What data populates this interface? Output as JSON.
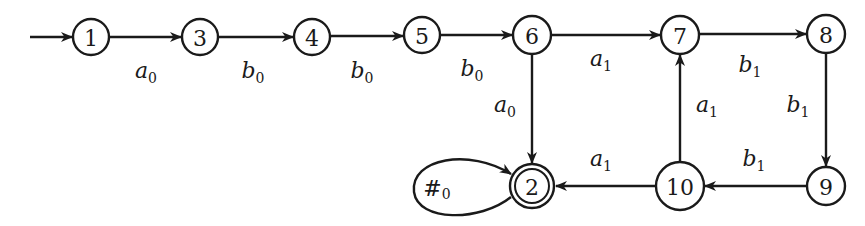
{
  "diagram": {
    "type": "finite-automaton",
    "start_state": "1",
    "accepting_states": [
      "2"
    ],
    "states": [
      {
        "id": "1",
        "label": "1",
        "x": 91,
        "y": 37,
        "r": 18,
        "accepting": false
      },
      {
        "id": "3",
        "label": "3",
        "x": 200,
        "y": 37,
        "r": 18,
        "accepting": false
      },
      {
        "id": "4",
        "label": "4",
        "x": 312,
        "y": 37,
        "r": 18,
        "accepting": false
      },
      {
        "id": "5",
        "label": "5",
        "x": 422,
        "y": 35,
        "r": 18,
        "accepting": false
      },
      {
        "id": "6",
        "label": "6",
        "x": 532,
        "y": 35,
        "r": 19,
        "accepting": false
      },
      {
        "id": "7",
        "label": "7",
        "x": 680,
        "y": 35,
        "r": 19,
        "accepting": false
      },
      {
        "id": "8",
        "label": "8",
        "x": 826,
        "y": 34,
        "r": 19,
        "accepting": false
      },
      {
        "id": "2",
        "label": "2",
        "x": 532,
        "y": 186,
        "r": 22,
        "accepting": true
      },
      {
        "id": "10",
        "label": "10",
        "x": 680,
        "y": 186,
        "r": 24,
        "accepting": false
      },
      {
        "id": "9",
        "label": "9",
        "x": 826,
        "y": 186,
        "r": 19,
        "accepting": false
      }
    ],
    "transitions": [
      {
        "from": "1",
        "to": "3",
        "symbol": "a",
        "subscript": "0",
        "label_x": 148,
        "label_y": 71
      },
      {
        "from": "3",
        "to": "4",
        "symbol": "b",
        "subscript": "0",
        "label_x": 255,
        "label_y": 71
      },
      {
        "from": "4",
        "to": "5",
        "symbol": "b",
        "subscript": "0",
        "label_x": 363,
        "label_y": 71
      },
      {
        "from": "5",
        "to": "6",
        "symbol": "b",
        "subscript": "0",
        "label_x": 473,
        "label_y": 69
      },
      {
        "from": "6",
        "to": "7",
        "symbol": "a",
        "subscript": "1",
        "label_x": 603,
        "label_y": 61
      },
      {
        "from": "7",
        "to": "8",
        "symbol": "b",
        "subscript": "1",
        "label_x": 752,
        "label_y": 68
      },
      {
        "from": "6",
        "to": "2",
        "symbol": "a",
        "subscript": "0",
        "label_x": 508,
        "label_y": 114
      },
      {
        "from": "10",
        "to": "7",
        "symbol": "a",
        "subscript": "1",
        "label_x": 708,
        "label_y": 114
      },
      {
        "from": "8",
        "to": "9",
        "symbol": "b",
        "subscript": "1",
        "label_x": 800,
        "label_y": 114
      },
      {
        "from": "9",
        "to": "10",
        "symbol": "b",
        "subscript": "1",
        "label_x": 756,
        "label_y": 164
      },
      {
        "from": "10",
        "to": "2",
        "symbol": "a",
        "subscript": "1",
        "label_x": 603,
        "label_y": 164
      },
      {
        "from": "2",
        "to": "2",
        "symbol": "#",
        "subscript": "0",
        "self_loop": true,
        "label_x": 437,
        "label_y": 194
      }
    ],
    "labels": {
      "t_1_3": "a",
      "t_3_4": "b",
      "t_4_5": "b",
      "t_5_6": "b",
      "t_6_7": "a",
      "t_7_8": "b",
      "t_6_2": "a",
      "t_10_7": "a",
      "t_8_9": "b",
      "t_9_10": "b",
      "t_10_2": "a",
      "t_2_2": "#",
      "sub_0": "0",
      "sub_1": "1"
    },
    "colors": {
      "stroke": "#1a1a1a",
      "background": "#ffffff"
    }
  }
}
